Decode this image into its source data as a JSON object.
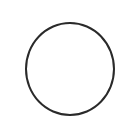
{
  "control": {
    "type": "radio",
    "checked": false,
    "border_color": "#2a2a2a",
    "fill_color": "#ffffff",
    "icon": "circle-outline-icon"
  }
}
